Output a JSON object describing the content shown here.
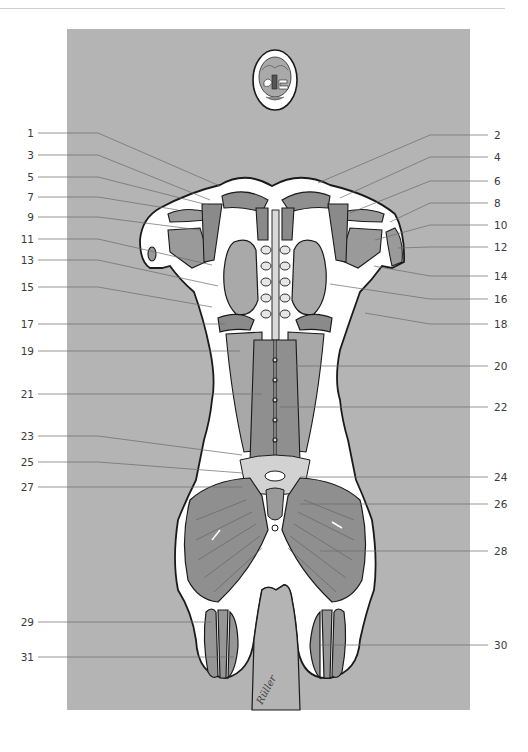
{
  "figure": {
    "title": "",
    "colors": {
      "panel_background": "#b4b4b4",
      "body_outline": "#ffffff",
      "muscle": "#8f8f8f",
      "muscle_light": "#a8a8a8",
      "organ": "#9d9d9d",
      "stroke": "#1a1a1a",
      "leader_line": "#6a6a6a",
      "label_text": "#3a3a3a"
    },
    "signature": "Rüller"
  },
  "labels_left": [
    {
      "num": "1",
      "y": 133,
      "tx": 220,
      "ty": 186
    },
    {
      "num": "3",
      "y": 155,
      "tx": 210,
      "ty": 200
    },
    {
      "num": "5",
      "y": 177,
      "tx": 208,
      "ty": 205
    },
    {
      "num": "7",
      "y": 197,
      "tx": 178,
      "ty": 210
    },
    {
      "num": "9",
      "y": 217,
      "tx": 200,
      "ty": 230
    },
    {
      "num": "11",
      "y": 239,
      "tx": 212,
      "ty": 265
    },
    {
      "num": "13",
      "y": 260,
      "tx": 218,
      "ty": 286
    },
    {
      "num": "15",
      "y": 287,
      "tx": 212,
      "ty": 307
    },
    {
      "num": "17",
      "y": 324,
      "tx": 225,
      "ty": 324
    },
    {
      "num": "19",
      "y": 351,
      "tx": 240,
      "ty": 351
    },
    {
      "num": "21",
      "y": 394,
      "tx": 262,
      "ty": 394
    },
    {
      "num": "23",
      "y": 436,
      "tx": 242,
      "ty": 455
    },
    {
      "num": "25",
      "y": 462,
      "tx": 243,
      "ty": 473
    },
    {
      "num": "27",
      "y": 487,
      "tx": 242,
      "ty": 487
    },
    {
      "num": "29",
      "y": 622,
      "tx": 212,
      "ty": 622
    },
    {
      "num": "31",
      "y": 657,
      "tx": 234,
      "ty": 657
    }
  ],
  "labels_right": [
    {
      "num": "2",
      "y": 135,
      "tx": 318,
      "ty": 183
    },
    {
      "num": "4",
      "y": 157,
      "tx": 340,
      "ty": 198
    },
    {
      "num": "6",
      "y": 181,
      "tx": 350,
      "ty": 213
    },
    {
      "num": "8",
      "y": 203,
      "tx": 390,
      "ty": 222
    },
    {
      "num": "10",
      "y": 225,
      "tx": 375,
      "ty": 240
    },
    {
      "num": "12",
      "y": 247,
      "tx": 398,
      "ty": 248
    },
    {
      "num": "14",
      "y": 276,
      "tx": 374,
      "ty": 266
    },
    {
      "num": "16",
      "y": 299,
      "tx": 330,
      "ty": 284
    },
    {
      "num": "18",
      "y": 324,
      "tx": 365,
      "ty": 313
    },
    {
      "num": "20",
      "y": 366,
      "tx": 296,
      "ty": 366
    },
    {
      "num": "22",
      "y": 407,
      "tx": 280,
      "ty": 407
    },
    {
      "num": "24",
      "y": 477,
      "tx": 300,
      "ty": 477
    },
    {
      "num": "26",
      "y": 504,
      "tx": 300,
      "ty": 504
    },
    {
      "num": "28",
      "y": 551,
      "tx": 320,
      "ty": 551
    },
    {
      "num": "30",
      "y": 645,
      "tx": 320,
      "ty": 645
    }
  ]
}
